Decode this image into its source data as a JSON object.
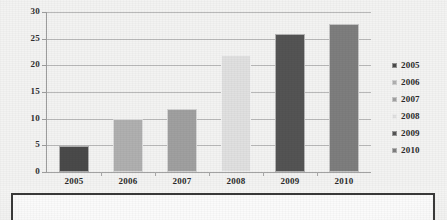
{
  "chart_data": {
    "type": "bar",
    "title": "",
    "subtitle": "",
    "xlabel": "",
    "ylabel": "",
    "categories": [
      "2005",
      "2006",
      "2007",
      "2008",
      "2009",
      "2010"
    ],
    "values": [
      4.8,
      9.9,
      11.8,
      22.0,
      25.8,
      27.7
    ],
    "bar_colors": [
      "#4a4a4a",
      "#b0b0b0",
      "#a0a0a0",
      "#e0e0e0",
      "#545454",
      "#7e7e7e"
    ],
    "ylim": [
      0,
      30
    ],
    "yticks": [
      0,
      5,
      10,
      15,
      20,
      25,
      30
    ],
    "ytick_labels": [
      "0",
      "5",
      "10",
      "15",
      "20",
      "25",
      "30"
    ],
    "grid": true,
    "grid_axis": "y",
    "legend_position": "right",
    "legend": [
      {
        "label": "2005",
        "color": "#4a4a4a"
      },
      {
        "label": "2006",
        "color": "#b0b0b0"
      },
      {
        "label": "2007",
        "color": "#a0a0a0"
      },
      {
        "label": "2008",
        "color": "#e0e0e0"
      },
      {
        "label": "2009",
        "color": "#545454"
      },
      {
        "label": "2010",
        "color": "#7e7e7e"
      }
    ]
  },
  "lower_box": {
    "text": ""
  }
}
